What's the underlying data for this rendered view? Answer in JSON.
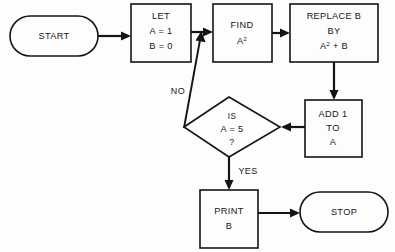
{
  "diagram": {
    "background_color": "#fdfdfd",
    "line_color": "#141414",
    "text_color": "#161616"
  },
  "nodes": {
    "start": {
      "name": "start-terminator",
      "shape": "stadium",
      "label": "START"
    },
    "let": {
      "name": "let-process",
      "shape": "rectangle",
      "line1": "LET",
      "line2": "A = 1",
      "line3": "B = 0"
    },
    "find": {
      "name": "find-process",
      "shape": "rectangle",
      "line1": "FIND",
      "line2_base": "A",
      "line2_sup": "2"
    },
    "replace": {
      "name": "replace-process",
      "shape": "rectangle",
      "line1": "REPLACE B",
      "line2": "BY",
      "line3_base": "A",
      "line3_sup": "2",
      "line3_tail": " + B"
    },
    "add": {
      "name": "add-process",
      "shape": "rectangle",
      "line1": "ADD 1",
      "line2": "TO",
      "line3": "A"
    },
    "decision": {
      "name": "decision-diamond",
      "shape": "diamond",
      "line1": "IS",
      "line2": "A = 5",
      "line3": "?"
    },
    "print": {
      "name": "print-process",
      "shape": "rectangle",
      "line1": "PRINT",
      "line2": "B"
    },
    "stop": {
      "name": "stop-terminator",
      "shape": "stadium",
      "label": "STOP"
    }
  },
  "edge_labels": {
    "no": "NO",
    "yes": "YES"
  }
}
